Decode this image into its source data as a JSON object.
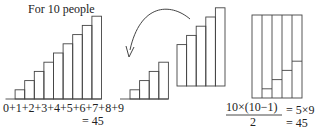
{
  "title": "For 10 people",
  "left_sum": {
    "expression": "0+1+2+3+4+5+6+7+8+9",
    "result": "= 45"
  },
  "formula": {
    "numerator": "10×(10−1)",
    "denominator": "2",
    "step": "= 5×9",
    "result": "= 45"
  },
  "staircase_left": {
    "heights": [
      0,
      1,
      2,
      3,
      4,
      5,
      6,
      7,
      8,
      9
    ]
  },
  "staircase_small": {
    "heights": [
      1,
      2,
      3,
      4
    ]
  },
  "staircase_moved": {
    "heights": [
      5,
      6,
      7,
      8,
      9
    ]
  },
  "combined_rect": {
    "columns": 5,
    "split_heights": [
      0,
      1,
      2,
      3,
      4
    ]
  },
  "colors": {
    "line": "#444444",
    "text": "#222222",
    "background": "#ffffff"
  }
}
